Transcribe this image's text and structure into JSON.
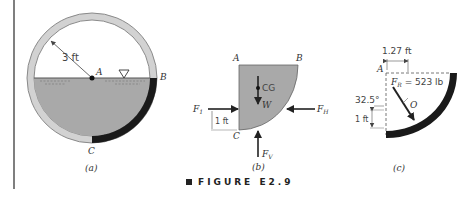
{
  "figure": {
    "caption": "FIGURE E2.9",
    "colors": {
      "tank_ring": "#d2d2d2",
      "ring_stroke": "#8a8a8a",
      "water": "#a9a9a9",
      "wall_dark": "#1a1a1a",
      "arrow": "#222222",
      "text": "#333333"
    }
  },
  "panel_a": {
    "label": "(a)",
    "radius_label": "3 ft",
    "point_A": "A",
    "point_B": "B",
    "point_C": "C",
    "free_surface_symbol": "free-surface-triangle"
  },
  "panel_b": {
    "label": "(b)",
    "point_A": "A",
    "point_B": "B",
    "point_C": "C",
    "cg_label": "CG",
    "weight_label": "W",
    "f1_label": "F",
    "f1_sub": "1",
    "fh_label": "F",
    "fh_sub": "H",
    "fv_label": "F",
    "fv_sub": "V",
    "dim_label": "1 ft"
  },
  "panel_c": {
    "label": "(c)",
    "point_A": "A",
    "point_O": "O",
    "horizontal_dim": "1.27 ft",
    "vertical_dim": "1 ft",
    "angle_label": "32.5°",
    "fr_label": "F",
    "fr_sub": "R",
    "fr_value": " = 523 lb"
  }
}
